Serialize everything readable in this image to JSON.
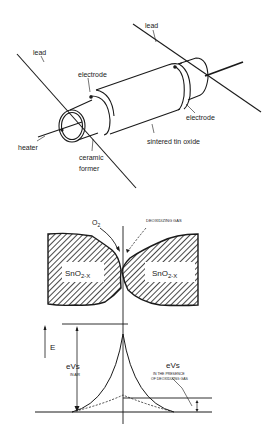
{
  "figure": {
    "top_diagram": {
      "title": "Sintered tin oxide gas sensor",
      "labels": {
        "lead_left": "lead",
        "lead_right": "lead",
        "electrode_left": "electrode",
        "electrode_right": "electrode",
        "heater": "heater",
        "ceramic_line1": "ceramic",
        "ceramic_line2": "former",
        "sintered": "sintered tin oxide"
      }
    },
    "bottom_diagram": {
      "labels": {
        "o2": "O",
        "o2_sub": "2",
        "deoxidizing_gas": "DEOXIDIZING GAS",
        "grain_left": "SnO",
        "grain_left_sub": "2-X",
        "grain_right": "SnO",
        "grain_right_sub": "2-X",
        "energy_axis": "E",
        "evs_air": "eVs",
        "evs_air_note": "IN AIR",
        "evs_gas": "eVs",
        "evs_gas_note_line1": "IN THE PRESENCE",
        "evs_gas_note_line2": "OF DEOXIDIZING GAS"
      }
    },
    "colors": {
      "ink": "#1a1a1a",
      "background": "#ffffff"
    }
  }
}
